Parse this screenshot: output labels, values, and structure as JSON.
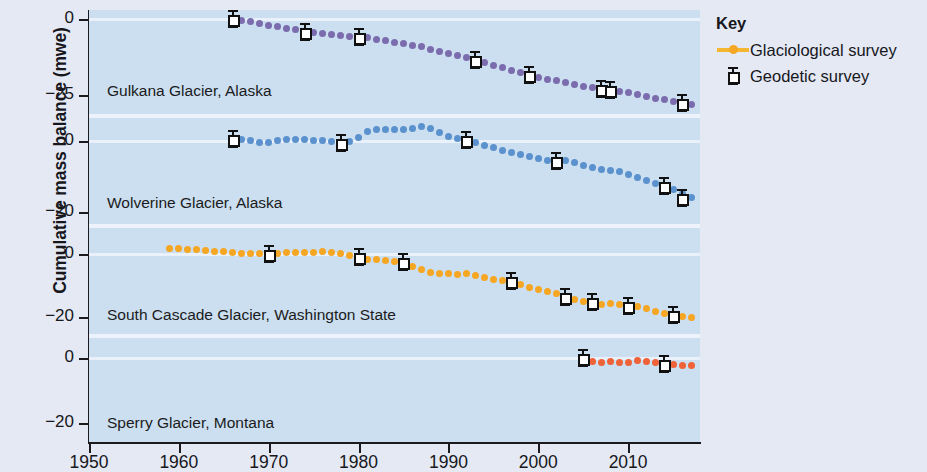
{
  "axis": {
    "y_title": "Cumulative mass balance (mwe)",
    "x_ticks": [
      "1950",
      "1960",
      "1970",
      "1980",
      "1990",
      "2000",
      "2010"
    ],
    "panel_y_ticks": [
      [
        "0",
        "−25"
      ],
      [
        "0",
        "−20"
      ],
      [
        "0",
        "−20"
      ],
      [
        "0",
        "−20"
      ]
    ]
  },
  "legend": {
    "title": "Key",
    "items": [
      {
        "label": "Glaciological survey",
        "icon": "line-with-dot-icon",
        "color": "#f5a623"
      },
      {
        "label": "Geodetic survey",
        "icon": "error-bar-square-icon",
        "color": "#111111"
      }
    ]
  },
  "panels": [
    {
      "label": "Gulkana Glacier, Alaska",
      "color": "#7b6cae"
    },
    {
      "label": "Wolverine Glacier, Alaska",
      "color": "#5b92cd"
    },
    {
      "label": "South Cascade Glacier, Washington State",
      "color": "#f5a623"
    },
    {
      "label": "Sperry Glacier, Montana",
      "color": "#ef6137"
    }
  ],
  "chart_data": {
    "type": "line",
    "xlabel": "",
    "ylabel": "Cumulative mass balance (mwe)",
    "xlim": [
      1950,
      2018
    ],
    "grid": false,
    "legend_position": "right",
    "panels": [
      {
        "name": "Gulkana Glacier, Alaska",
        "color": "#7b6cae",
        "ylim": [
          -32,
          3
        ],
        "yticks": [
          0,
          -25
        ],
        "series": [
          {
            "name": "Glaciological survey",
            "x": [
              1966,
              1967,
              1968,
              1969,
              1970,
              1971,
              1972,
              1973,
              1974,
              1975,
              1976,
              1977,
              1978,
              1979,
              1980,
              1981,
              1982,
              1983,
              1984,
              1985,
              1986,
              1987,
              1988,
              1989,
              1990,
              1991,
              1992,
              1993,
              1994,
              1995,
              1996,
              1997,
              1998,
              1999,
              2000,
              2001,
              2002,
              2003,
              2004,
              2005,
              2006,
              2007,
              2008,
              2009,
              2010,
              2011,
              2012,
              2013,
              2014,
              2015,
              2016,
              2017
            ],
            "y": [
              0.0,
              -0.4,
              -0.9,
              -1.5,
              -2.1,
              -2.6,
              -3.1,
              -3.6,
              -4.1,
              -4.4,
              -4.7,
              -5.0,
              -5.3,
              -5.6,
              -5.9,
              -6.2,
              -6.6,
              -7.1,
              -7.6,
              -8.1,
              -8.6,
              -9.2,
              -9.9,
              -10.6,
              -11.3,
              -12.0,
              -12.8,
              -13.6,
              -14.4,
              -15.2,
              -16.0,
              -16.9,
              -17.7,
              -18.5,
              -19.2,
              -19.8,
              -20.4,
              -21.0,
              -21.6,
              -22.1,
              -22.6,
              -23.0,
              -23.4,
              -23.9,
              -24.4,
              -25.0,
              -25.6,
              -26.2,
              -26.7,
              -27.2,
              -27.7,
              -28.2
            ]
          },
          {
            "name": "Geodetic survey",
            "x": [
              1966,
              1974,
              1980,
              1993,
              1999,
              2007,
              2008,
              2016
            ],
            "y": [
              0.0,
              -4.1,
              -5.9,
              -13.6,
              -18.5,
              -23.0,
              -23.4,
              -27.7
            ],
            "yerr": [
              1.0,
              1.0,
              1.0,
              1.0,
              1.0,
              1.0,
              1.0,
              1.0
            ]
          }
        ]
      },
      {
        "name": "Wolverine Glacier, Alaska",
        "color": "#5b92cd",
        "ylim": [
          -24,
          7
        ],
        "yticks": [
          0,
          -20
        ],
        "series": [
          {
            "name": "Glaciological survey",
            "x": [
              1966,
              1967,
              1968,
              1969,
              1970,
              1971,
              1972,
              1973,
              1974,
              1975,
              1976,
              1977,
              1978,
              1979,
              1980,
              1981,
              1982,
              1983,
              1984,
              1985,
              1986,
              1987,
              1988,
              1989,
              1990,
              1991,
              1992,
              1993,
              1994,
              1995,
              1996,
              1997,
              1998,
              1999,
              2000,
              2001,
              2002,
              2003,
              2004,
              2005,
              2006,
              2007,
              2008,
              2009,
              2010,
              2011,
              2012,
              2013,
              2014,
              2015,
              2016,
              2017
            ],
            "y": [
              0.6,
              0.4,
              0.1,
              -0.5,
              -0.4,
              0.2,
              0.5,
              0.4,
              0.3,
              0.2,
              0.1,
              -0.3,
              -0.5,
              -0.1,
              0.9,
              2.6,
              3.2,
              3.1,
              3.2,
              3.1,
              3.4,
              4.0,
              3.4,
              2.3,
              1.2,
              0.7,
              0.2,
              -0.6,
              -1.3,
              -2.0,
              -2.7,
              -3.4,
              -3.9,
              -4.4,
              -5.0,
              -5.6,
              -5.7,
              -5.6,
              -6.0,
              -6.9,
              -7.6,
              -8.0,
              -8.3,
              -8.6,
              -9.4,
              -10.3,
              -11.1,
              -12.0,
              -12.8,
              -13.8,
              -14.9,
              -16.0
            ]
          },
          {
            "name": "Geodetic survey",
            "x": [
              1966,
              1978,
              1992,
              2002,
              2014,
              2016
            ],
            "y": [
              0.6,
              -0.5,
              0.2,
              -5.7,
              -12.8,
              -16.0
            ],
            "yerr": [
              1.2,
              1.2,
              1.2,
              1.2,
              1.2,
              1.2
            ]
          }
        ]
      },
      {
        "name": "South Cascade Glacier, Washington State",
        "color": "#f5a623",
        "ylim": [
          -26,
          9
        ],
        "yticks": [
          0,
          -20
        ],
        "series": [
          {
            "name": "Glaciological survey",
            "x": [
              1959,
              1960,
              1961,
              1962,
              1963,
              1964,
              1965,
              1966,
              1967,
              1968,
              1969,
              1970,
              1971,
              1972,
              1973,
              1974,
              1975,
              1976,
              1977,
              1978,
              1979,
              1980,
              1981,
              1982,
              1983,
              1984,
              1985,
              1986,
              1987,
              1988,
              1989,
              1990,
              1991,
              1992,
              1993,
              1994,
              1995,
              1996,
              1997,
              1998,
              1999,
              2000,
              2001,
              2002,
              2003,
              2004,
              2005,
              2006,
              2007,
              2008,
              2009,
              2010,
              2011,
              2012,
              2013,
              2014,
              2015,
              2016,
              2017
            ],
            "y": [
              2.0,
              1.7,
              1.5,
              1.4,
              1.1,
              0.9,
              0.8,
              0.6,
              0.4,
              0.2,
              0.1,
              0.0,
              0.3,
              0.6,
              0.5,
              0.7,
              0.6,
              0.8,
              0.5,
              0.2,
              -0.3,
              -0.8,
              -1.6,
              -1.6,
              -2.0,
              -2.4,
              -3.2,
              -4.0,
              -4.9,
              -5.7,
              -6.0,
              -6.1,
              -6.3,
              -6.2,
              -6.6,
              -7.3,
              -8.1,
              -8.4,
              -8.6,
              -9.5,
              -10.5,
              -11.1,
              -11.8,
              -12.6,
              -13.6,
              -14.5,
              -15.1,
              -15.3,
              -15.9,
              -15.8,
              -16.0,
              -16.6,
              -16.6,
              -17.4,
              -18.1,
              -18.7,
              -19.4,
              -19.8,
              -20.1
            ]
          },
          {
            "name": "Geodetic survey",
            "x": [
              1970,
              1980,
              1985,
              1997,
              2003,
              2006,
              2010,
              2015
            ],
            "y": [
              0.0,
              -0.8,
              -2.4,
              -8.6,
              -13.6,
              -15.3,
              -16.6,
              -19.4
            ],
            "yerr": [
              1.1,
              1.1,
              1.1,
              1.1,
              1.1,
              1.1,
              1.1,
              1.1
            ]
          }
        ]
      },
      {
        "name": "Sperry Glacier, Montana",
        "color": "#ef6137",
        "ylim": [
          -26,
          7
        ],
        "yticks": [
          0,
          -20
        ],
        "series": [
          {
            "name": "Glaciological survey",
            "x": [
              2005,
              2006,
              2007,
              2008,
              2009,
              2010,
              2011,
              2012,
              2013,
              2014,
              2015,
              2016,
              2017
            ],
            "y": [
              0.0,
              -0.8,
              -1.2,
              -0.9,
              -1.4,
              -1.1,
              -0.6,
              -0.8,
              -1.1,
              -1.8,
              -2.0,
              -2.1,
              -2.2
            ]
          },
          {
            "name": "Geodetic survey",
            "x": [
              2005,
              2014
            ],
            "y": [
              0.0,
              -1.8
            ],
            "yerr": [
              1.2,
              1.2
            ]
          }
        ]
      }
    ]
  }
}
